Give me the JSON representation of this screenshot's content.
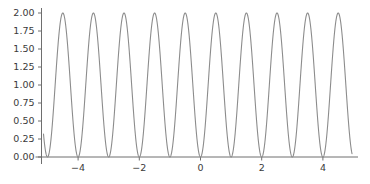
{
  "chart_data": {
    "type": "line",
    "title": "",
    "xlabel": "",
    "ylabel": "",
    "xlim": [
      -4.62,
      -4.62
    ],
    "ylim": [
      0,
      2
    ],
    "grid": false,
    "legend": null,
    "line_color": "#8c8c8c",
    "line_width": 1.1,
    "function": "1 - cos(2*pi*x)",
    "period": 1,
    "amplitude_min": 0.0,
    "amplitude_max": 2.0,
    "peak_count": 9,
    "peak_x": [
      -4,
      -3,
      -2,
      -1,
      0,
      1,
      2,
      3,
      4
    ],
    "peak_y": [
      2.0,
      2.0,
      2.0,
      2.0,
      2.0,
      2.0,
      2.0,
      2.0,
      2.0
    ],
    "trough_x": [
      -4.5,
      -3.5,
      -2.5,
      -1.5,
      -0.5,
      0.5,
      1.5,
      2.5,
      3.5,
      4.5
    ],
    "trough_y": [
      0.0,
      0.0,
      0.0,
      0.0,
      0.0,
      0.0,
      0.0,
      0.0,
      0.0,
      0.0
    ],
    "x_ticks": [
      -4,
      -2,
      0,
      2,
      4
    ],
    "x_tick_labels": [
      "−4",
      "−2",
      "0",
      "2",
      "4"
    ],
    "y_ticks": [
      0.0,
      0.25,
      0.5,
      0.75,
      1.0,
      1.25,
      1.5,
      1.75,
      2.0
    ],
    "y_tick_labels": [
      "0.00",
      "0.25",
      "0.50",
      "0.75",
      "1.00",
      "1.25",
      "1.50",
      "1.75",
      "2.00"
    ],
    "axis_color": "#6e6e6e",
    "tick_label_color": "#3a3a3a",
    "spines": {
      "left": true,
      "bottom": true,
      "top": false,
      "right": false
    }
  },
  "figure": {
    "background": "#ffffff",
    "width": 370,
    "height": 184
  }
}
